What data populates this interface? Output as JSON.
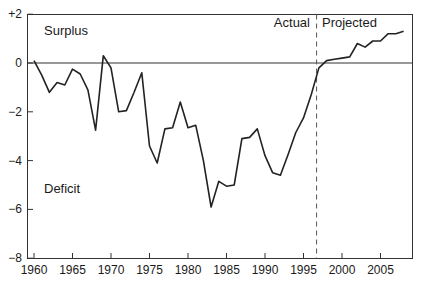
{
  "chart_data": {
    "type": "line",
    "title": "",
    "xlabel": "",
    "ylabel": "",
    "xlim": [
      1959.1,
      2008.8
    ],
    "ylim": [
      -8,
      2
    ],
    "grid": false,
    "legend": null,
    "x_ticks": [
      1960,
      1965,
      1970,
      1975,
      1980,
      1985,
      1990,
      1995,
      2000,
      2005
    ],
    "x_tick_labels": [
      "1960",
      "1965",
      "1970",
      "1975",
      "1980",
      "1985",
      "1990",
      "1995",
      "2000",
      "2005"
    ],
    "y_ticks": [
      2,
      0,
      -2,
      -4,
      -6,
      -8
    ],
    "y_tick_labels": [
      "+2",
      "0",
      "−2",
      "−4",
      "−6",
      "−8"
    ],
    "reference_line": {
      "y": 0,
      "style": "solid"
    },
    "divider": {
      "x": 1996.7,
      "style": "dashed",
      "left_label": "Actual",
      "right_label": "Projected"
    },
    "annotations": [
      {
        "text": "Surplus",
        "x": 1961.5,
        "y": 1.3
      },
      {
        "text": "Deficit",
        "x": 1961.5,
        "y": -5.1
      }
    ],
    "series": [
      {
        "name": "Budget balance",
        "x": [
          1960,
          1961,
          1962,
          1963,
          1964,
          1965,
          1966,
          1967,
          1968,
          1969,
          1970,
          1971,
          1972,
          1973,
          1974,
          1975,
          1976,
          1977,
          1978,
          1979,
          1980,
          1981,
          1982,
          1983,
          1984,
          1985,
          1986,
          1987,
          1988,
          1989,
          1990,
          1991,
          1992,
          1993,
          1994,
          1995,
          1996,
          1997,
          1998,
          1999,
          2000,
          2001,
          2002,
          2003,
          2004,
          2005,
          2006,
          2007,
          2008
        ],
        "values": [
          0.1,
          -0.5,
          -1.2,
          -0.8,
          -0.9,
          -0.25,
          -0.45,
          -1.1,
          -2.75,
          0.3,
          -0.2,
          -2.0,
          -1.95,
          -1.2,
          -0.4,
          -3.4,
          -4.1,
          -2.7,
          -2.65,
          -1.6,
          -2.65,
          -2.55,
          -4.0,
          -5.9,
          -4.85,
          -5.05,
          -5.0,
          -3.1,
          -3.05,
          -2.7,
          -3.8,
          -4.5,
          -4.6,
          -3.75,
          -2.85,
          -2.25,
          -1.3,
          -0.2,
          0.1,
          0.15,
          0.2,
          0.25,
          0.8,
          0.65,
          0.9,
          0.9,
          1.2,
          1.2,
          1.3
        ]
      }
    ]
  },
  "labels": {
    "surplus": "Surplus",
    "deficit": "Deficit",
    "actual": "Actual",
    "projected": "Projected"
  }
}
